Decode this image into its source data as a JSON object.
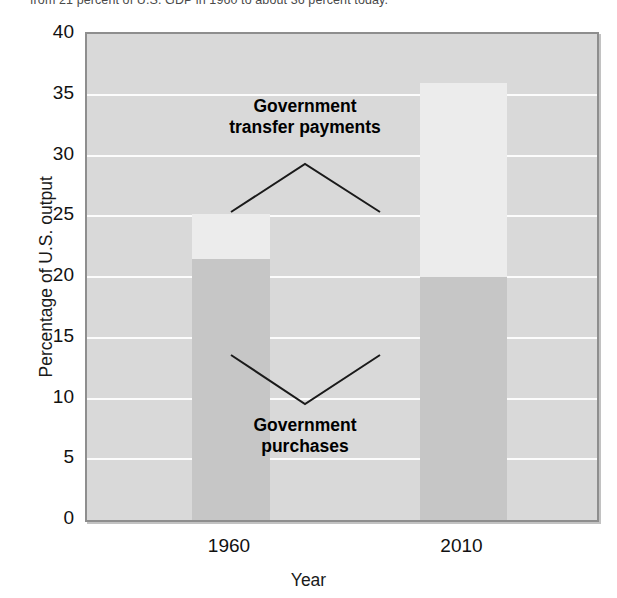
{
  "caption": {
    "text": "from 21 percent of U.S. GDP in 1960 to about 36 percent today."
  },
  "chart_data": {
    "type": "bar",
    "stacked": true,
    "title": "",
    "xlabel": "Year",
    "ylabel": "Percentage of U.S. output",
    "categories": [
      "1960",
      "2010"
    ],
    "ylim": [
      0,
      40
    ],
    "yticks": [
      0,
      5,
      10,
      15,
      20,
      25,
      30,
      35,
      40
    ],
    "ytick_labels": [
      "0",
      "5",
      "10",
      "15",
      "20",
      "25",
      "30",
      "35",
      "40"
    ],
    "grid": true,
    "grid_axis": "y",
    "legend_position": "in-plot-annotations",
    "series": [
      {
        "name": "Government purchases",
        "color": "#c6c6c6",
        "values": [
          21.5,
          20.0
        ]
      },
      {
        "name": "Government transfer payments",
        "color": "#ececec",
        "values": [
          3.7,
          16.0
        ]
      }
    ],
    "segment_tops": {
      "Government purchases": [
        21.5,
        20.0
      ],
      "Government transfer payments": [
        25.2,
        36.0
      ]
    },
    "annotations": [
      {
        "name": "transfers-annotation",
        "text": "Government\ntransfer payments",
        "line1": "Government",
        "line2": "transfer payments",
        "pointer": "caret-up",
        "points_to": [
          "1960-transfers",
          "2010-transfers"
        ]
      },
      {
        "name": "purchases-annotation",
        "text": "Government\npurchases",
        "line1": "Government",
        "line2": "purchases",
        "pointer": "caret-down",
        "points_to": [
          "1960-purchases",
          "2010-purchases"
        ]
      }
    ],
    "plot_background": "#d9d9d9",
    "gridline_color": "#ffffff",
    "axis_color": "#8e8e8e"
  }
}
